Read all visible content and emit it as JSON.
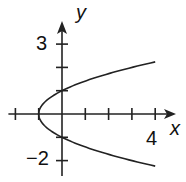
{
  "chart_data": {
    "type": "line",
    "title": "",
    "xlabel": "x",
    "ylabel": "y",
    "xlim": [
      -2,
      4
    ],
    "ylim": [
      -2,
      3
    ],
    "x_tick_labels": [
      {
        "value": 4,
        "label": "4"
      }
    ],
    "y_tick_labels": [
      {
        "value": 3,
        "label": "3"
      },
      {
        "value": -2,
        "label": "−2"
      }
    ],
    "x_ticks": [
      -2,
      -1,
      1,
      2,
      3,
      4
    ],
    "y_ticks": [
      -2,
      -1,
      1,
      2,
      3
    ],
    "grid": false,
    "series": [
      {
        "name": "x = y^2 - 1",
        "points": [
          [
            4,
            2.236
          ],
          [
            3,
            2
          ],
          [
            2,
            1.732
          ],
          [
            1,
            1.414
          ],
          [
            0,
            1
          ],
          [
            -0.75,
            0.5
          ],
          [
            -1,
            0
          ],
          [
            -0.75,
            -0.5
          ],
          [
            0,
            -1
          ],
          [
            1,
            -1.414
          ],
          [
            2,
            -1.732
          ],
          [
            3,
            -2
          ],
          [
            4,
            -2.236
          ]
        ]
      }
    ],
    "color": "#222222"
  },
  "labels": {
    "x_axis": "x",
    "y_axis": "y",
    "x_tick_4": "4",
    "y_tick_3": "3",
    "y_tick_neg2": "−2"
  }
}
